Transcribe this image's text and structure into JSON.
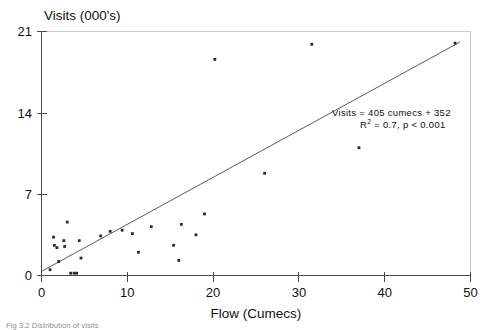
{
  "figure": {
    "caption": "Fig 3.2   Distribution of visits"
  },
  "chart_data": {
    "type": "scatter",
    "title": "",
    "xlabel": "Flow (Cumecs)",
    "ylabel": "Visits (000's)",
    "xlim": [
      0,
      50
    ],
    "ylim": [
      0,
      21
    ],
    "xticks": [
      0,
      10,
      20,
      30,
      40,
      50
    ],
    "yticks": [
      0,
      7,
      14,
      21
    ],
    "grid": false,
    "legend": null,
    "points": [
      {
        "x": 1.0,
        "y": 0.5
      },
      {
        "x": 1.4,
        "y": 3.3
      },
      {
        "x": 1.5,
        "y": 2.6
      },
      {
        "x": 1.8,
        "y": 2.4
      },
      {
        "x": 2.0,
        "y": 1.2
      },
      {
        "x": 2.6,
        "y": 3.0
      },
      {
        "x": 2.7,
        "y": 2.5
      },
      {
        "x": 3.0,
        "y": 4.6
      },
      {
        "x": 3.4,
        "y": 0.2
      },
      {
        "x": 3.8,
        "y": 0.2
      },
      {
        "x": 4.1,
        "y": 0.2
      },
      {
        "x": 4.4,
        "y": 3.0
      },
      {
        "x": 4.6,
        "y": 1.5
      },
      {
        "x": 6.9,
        "y": 3.4
      },
      {
        "x": 8.0,
        "y": 3.8
      },
      {
        "x": 9.4,
        "y": 3.9
      },
      {
        "x": 10.6,
        "y": 3.6
      },
      {
        "x": 11.3,
        "y": 2.0
      },
      {
        "x": 12.8,
        "y": 4.2
      },
      {
        "x": 15.4,
        "y": 2.6
      },
      {
        "x": 16.0,
        "y": 1.3
      },
      {
        "x": 16.3,
        "y": 4.4
      },
      {
        "x": 18.0,
        "y": 3.5
      },
      {
        "x": 19.0,
        "y": 5.3
      },
      {
        "x": 20.2,
        "y": 18.6
      },
      {
        "x": 26.0,
        "y": 8.8
      },
      {
        "x": 31.5,
        "y": 19.9
      },
      {
        "x": 37.0,
        "y": 11.0
      },
      {
        "x": 48.2,
        "y": 20.0
      }
    ],
    "fit_line": {
      "x_start": 0.0,
      "y_start": 0.35,
      "x_end": 48.8,
      "y_end": 20.1
    },
    "annotation": {
      "line1": "Visits = 405 cumecs + 352",
      "line2_prefix": "R",
      "line2_sup": "2",
      "line2_rest": " = 0.7, p < 0.001"
    }
  }
}
